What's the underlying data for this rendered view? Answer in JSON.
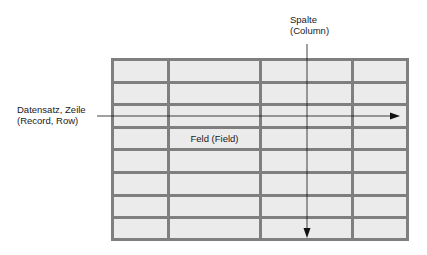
{
  "diagram": {
    "column_label_line1": "Spalte",
    "column_label_line2": "(Column)",
    "row_label_line1": "Datensatz, Zeile",
    "row_label_line2": "(Record, Row)",
    "field_label": "Feld (Field)",
    "grid": {
      "columns": 4,
      "rows": 8,
      "cell_color": "#ebebeb",
      "border_color": "#7f7f7f"
    }
  }
}
